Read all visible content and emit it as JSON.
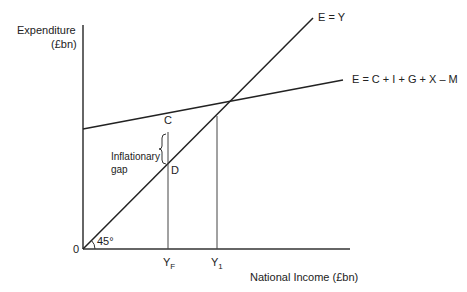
{
  "diagram": {
    "type": "keynesian-cross",
    "y_axis_label_line1": "Expenditure",
    "y_axis_label_line2": "(£bn)",
    "x_axis_label": "National Income (£bn)",
    "origin_label": "0",
    "angle_label": "45°",
    "line_45_label": "E = Y",
    "ad_line_label": "E = C + I + G + X – M",
    "point_c": "C",
    "point_d": "D",
    "gap_label_line1": "Inflationary",
    "gap_label_line2": "gap",
    "tick_yf_main": "Y",
    "tick_yf_sub": "F",
    "tick_y1_main": "Y",
    "tick_y1_sub": "1"
  }
}
